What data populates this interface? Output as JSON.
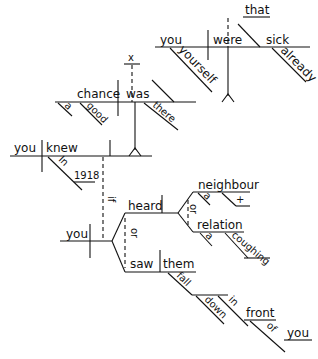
{
  "diagram": {
    "type": "sentence-diagram",
    "clauses": {
      "that_clause": {
        "connector": "that",
        "subject": "you",
        "appositive": "yourself",
        "verb": "were",
        "complement": "sick",
        "modifier": "already"
      },
      "chance_clause": {
        "expletive": "x",
        "subject": "chance",
        "subject_modifiers": [
          "a",
          "good"
        ],
        "verb": "was",
        "modifier": "there"
      },
      "main_clause": {
        "subject": "you",
        "verb": "knew",
        "preposition": "In",
        "prep_object": "1918"
      },
      "if_clause": {
        "connector": "if",
        "subject": "you",
        "verb_conjunction": "or",
        "verb1": {
          "verb": "heard",
          "objects_conjunction": "or",
          "objects": [
            {
              "noun": "neighbour",
              "modifiers": [
                "a",
                "+"
              ]
            },
            {
              "noun": "relation",
              "modifiers": [
                "a",
                "coughing"
              ]
            }
          ]
        },
        "verb2": {
          "verb": "saw",
          "object": "them",
          "complement": "fall",
          "complement_modifiers": [
            "down"
          ],
          "prepositional": {
            "preposition": "in",
            "object": "front",
            "nested": {
              "preposition": "of",
              "object": "you"
            }
          }
        }
      }
    },
    "words": {
      "that": "that",
      "you1": "you",
      "yourself": "yourself",
      "were": "were",
      "sick": "sick",
      "already": "already",
      "x": "x",
      "chance": "chance",
      "a1": "a",
      "good": "good",
      "was": "was",
      "there": "there",
      "you2": "you",
      "knew": "knew",
      "in1": "In",
      "y1918": "1918",
      "if": "if",
      "you3": "you",
      "heard": "heard",
      "or1": "or",
      "neighbour": "neighbour",
      "a2": "a",
      "plus": "+",
      "or2": "or",
      "relation": "relation",
      "a3": "a",
      "coughing": "coughing",
      "saw": "saw",
      "them": "them",
      "fall": "fall",
      "down": "down",
      "in2": "in",
      "front": "front",
      "of": "of",
      "you4": "you"
    }
  }
}
